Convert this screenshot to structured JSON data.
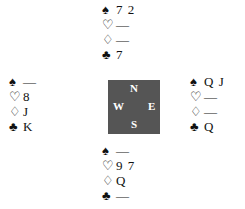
{
  "hands": {
    "north": {
      "spades": "7 2",
      "hearts": "—",
      "diamonds": "—",
      "clubs": "7"
    },
    "west": {
      "spades": "—",
      "hearts": "8",
      "diamonds": "J",
      "clubs": "K"
    },
    "east": {
      "spades": "Q J",
      "hearts": "—",
      "diamonds": "—",
      "clubs": "Q"
    },
    "south": {
      "spades": "—",
      "hearts": "9 7",
      "diamonds": "Q",
      "clubs": "—"
    }
  },
  "suit_icons": {
    "spades": "♠",
    "hearts": "♡",
    "diamonds": "♢",
    "clubs": "♣"
  },
  "compass": {
    "n": "N",
    "s": "S",
    "w": "W",
    "e": "E",
    "color": "#555555"
  }
}
